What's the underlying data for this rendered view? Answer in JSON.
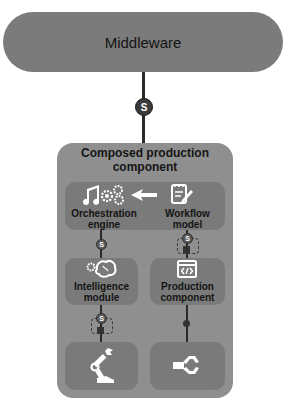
{
  "diagram": {
    "middleware": {
      "label": "Middleware"
    },
    "connector_top": {
      "badge": "S"
    },
    "composed": {
      "title_line1": "Composed production",
      "title_line2": "component",
      "orchestration": {
        "label_line1": "Orchestration",
        "label_line2": "engine",
        "icon": "music-gears-icon"
      },
      "arrow": {
        "direction": "left",
        "icon": "arrow-left-icon"
      },
      "workflow": {
        "label_line1": "Workflow",
        "label_line2": "model",
        "icon": "notepad-pen-icon"
      },
      "intelligence": {
        "label_line1": "Intelligence",
        "label_line2": "module",
        "icon": "brain-gear-icon"
      },
      "production": {
        "label_line1": "Production",
        "label_line2": "component",
        "icon": "code-window-icon"
      },
      "robot_arm": {
        "icon": "robot-arm-icon"
      },
      "gripper": {
        "icon": "gripper-icon"
      },
      "connector_orch_intel": {
        "badge": "S"
      },
      "connector_workflow_prod": {
        "badge": "S"
      },
      "connector_intel_arm": {
        "badge": "S"
      }
    },
    "colors": {
      "middleware_fill": "#7b7b7b",
      "composed_fill": "#8f8f8f",
      "inner_fill": "#7a7a7a",
      "line": "#2a2a2a",
      "icon": "#ffffff"
    }
  }
}
